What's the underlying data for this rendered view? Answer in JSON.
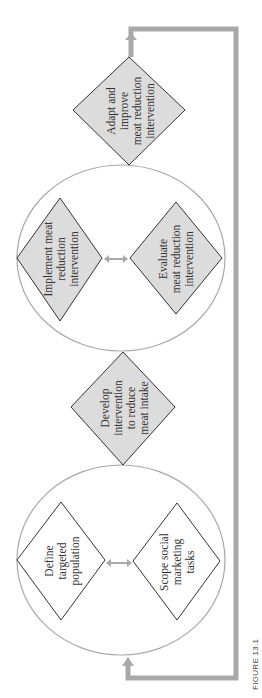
{
  "figure": {
    "caption": "FIGURE 13.1",
    "orientation": "rotated -90deg (reads bottom-to-top)"
  },
  "colors": {
    "diamond_fill_gray": "#dcdcdc",
    "diamond_fill_white": "#ffffff",
    "diamond_stroke": "#333333",
    "circle_stroke": "#a8a8a8",
    "feedback_arrow": "#a9a9a9",
    "text": "#333333"
  },
  "nodes": {
    "define": {
      "lines": [
        "Define",
        "targeted",
        "population"
      ]
    },
    "scope": {
      "lines": [
        "Scope social",
        "marketing",
        "tasks"
      ]
    },
    "develop": {
      "lines": [
        "Develop",
        "intervention",
        "to reduce",
        "meat intake"
      ]
    },
    "implement": {
      "lines": [
        "Implement meat",
        "reduction",
        "intervention"
      ]
    },
    "evaluate": {
      "lines": [
        "Evaluate",
        "meat reduction",
        "intervention"
      ]
    },
    "adapt": {
      "lines": [
        "Adapt and",
        "improve",
        "meat reduction",
        "intervention"
      ]
    }
  },
  "groups": [
    {
      "name": "scoping-phase",
      "members": [
        "define",
        "scope"
      ]
    },
    {
      "name": "implementation-phase",
      "members": [
        "implement",
        "evaluate"
      ]
    }
  ],
  "edges": [
    {
      "from": "define",
      "to": "scope",
      "type": "bidirectional"
    },
    {
      "from": "implement",
      "to": "evaluate",
      "type": "bidirectional"
    },
    {
      "from": "scoping-phase",
      "to": "develop",
      "type": "sequence"
    },
    {
      "from": "develop",
      "to": "implementation-phase",
      "type": "sequence"
    },
    {
      "from": "implementation-phase",
      "to": "adapt",
      "type": "sequence"
    },
    {
      "from": "adapt",
      "to": "scoping-phase",
      "type": "feedback-loop"
    }
  ]
}
